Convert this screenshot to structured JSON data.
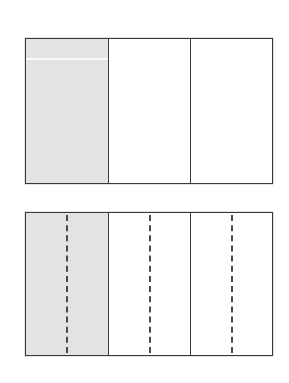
{
  "figure": {
    "type": "fraction-bar-comparison",
    "background_color": "#ffffff",
    "shaded_color": "#e3e3e3",
    "unshaded_color": "#ffffff",
    "stroke_color": "#3a3a3a",
    "dash_color": "#4a4a4a",
    "bars": [
      {
        "id": "top-bar",
        "label": "",
        "total_parts": 3,
        "shaded_parts": 1,
        "fraction": "1/3",
        "has_dashed_subdivisions": false,
        "subdivisions_per_part": 1,
        "parts": [
          {
            "index": 1,
            "shaded": true,
            "fill": "#e3e3e3"
          },
          {
            "index": 2,
            "shaded": false,
            "fill": "#ffffff"
          },
          {
            "index": 3,
            "shaded": false,
            "fill": "#ffffff"
          }
        ]
      },
      {
        "id": "bottom-bar",
        "label": "",
        "total_parts": 3,
        "shaded_parts": 1,
        "fraction": "2/6",
        "has_dashed_subdivisions": true,
        "subdivisions_per_part": 2,
        "parts": [
          {
            "index": 1,
            "shaded": true,
            "fill": "#e3e3e3"
          },
          {
            "index": 2,
            "shaded": false,
            "fill": "#ffffff"
          },
          {
            "index": 3,
            "shaded": false,
            "fill": "#ffffff"
          }
        ]
      }
    ]
  },
  "chart_data": {
    "type": "bar",
    "title": "",
    "subtitle": "",
    "xlabel": "",
    "ylabel": "",
    "grid": false,
    "legend": "none",
    "orientation": "horizontal",
    "categories": [
      "top-bar",
      "bottom-bar"
    ],
    "series": [
      {
        "name": "shaded fraction",
        "values": [
          0.3333,
          0.3333
        ]
      }
    ],
    "annotations": [
      "Top bar: whole divided into 3 equal parts, 1 part shaded (1/3)",
      "Bottom bar: same whole divided into 3 parts with dashed halves, 2 of 6 shaded (2/6)"
    ]
  },
  "caption": {
    "text": ""
  }
}
